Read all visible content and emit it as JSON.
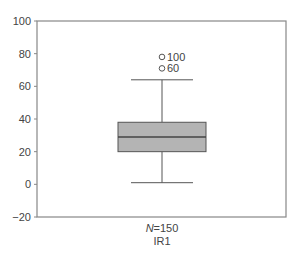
{
  "chart_data": {
    "type": "box",
    "title": "",
    "xlabel": "",
    "ylabel": "",
    "ylim": [
      -20,
      100
    ],
    "yticks": [
      100,
      80,
      60,
      40,
      20,
      0,
      -20
    ],
    "ytick_labels": [
      "100",
      "80",
      "60",
      "40",
      "20",
      "0",
      "−20"
    ],
    "grid": false,
    "categories": [
      "IR1"
    ],
    "series": [
      {
        "name": "IR1",
        "n_label": "N=150",
        "n_prefix": "N",
        "n_value": "=150",
        "whisker_low": 1,
        "q1": 20,
        "median": 29,
        "q3": 38,
        "whisker_high": 64,
        "outliers": [
          {
            "value": 78,
            "label": "100"
          },
          {
            "value": 71,
            "label": "60"
          }
        ]
      }
    ],
    "colors": {
      "box_fill": "#b4b4b4",
      "stroke": "#555555",
      "frame": "#888888"
    }
  }
}
